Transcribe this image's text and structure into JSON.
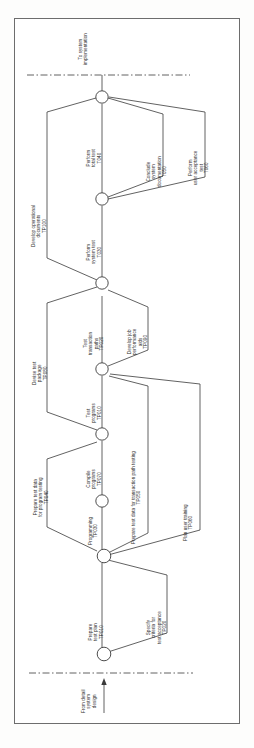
{
  "figure": {
    "type": "network-diagram",
    "orientation": "rotated-90-counterclockwise",
    "entry_label": "From detail\nsystem\ndesign",
    "entry_label_lines": [
      "From detail",
      "system",
      "design"
    ],
    "exit_label_lines": [
      "To system",
      "implementation"
    ],
    "boundary_style": "dash-dot"
  },
  "nodes": [
    {
      "id": "n1",
      "name": "event-node-1"
    },
    {
      "id": "n2",
      "name": "event-node-2"
    },
    {
      "id": "n3",
      "name": "event-node-3"
    },
    {
      "id": "n4",
      "name": "event-node-4"
    },
    {
      "id": "n5",
      "name": "event-node-5"
    },
    {
      "id": "n6",
      "name": "event-node-6"
    },
    {
      "id": "n7",
      "name": "event-node-7"
    },
    {
      "id": "n8",
      "name": "event-node-8"
    }
  ],
  "activities": [
    {
      "name": "Prepare\ntest plan",
      "lines": [
        "Prepare",
        "test plan"
      ],
      "code": "TP010"
    },
    {
      "name": "Specify\ncriteria for\ntest acceptance",
      "lines": [
        "Specify",
        "criteria for",
        "test acceptance"
      ],
      "code": "TP020"
    },
    {
      "name": "Programming",
      "lines": [
        "Programming"
      ],
      "code": "TP030"
    },
    {
      "name": "Prepare test data\nfor program testing",
      "lines": [
        "Prepare test data",
        "for program testing"
      ],
      "code": "TP040"
    },
    {
      "name": "Prepare test data for transaction path testing",
      "lines": [
        "Prepare test data for transaction path testing"
      ],
      "code": "TP050"
    },
    {
      "name": "Plan user training",
      "lines": [
        "Plan user training"
      ],
      "code": "TP060"
    },
    {
      "name": "Compile\nprograms",
      "lines": [
        "Compile",
        "programs"
      ],
      "code": "TP070"
    },
    {
      "name": "Test\nprograms",
      "lines": [
        "Test",
        "programs"
      ],
      "code": "TP010"
    },
    {
      "name": "Test\ntransaction\npaths",
      "lines": [
        "Test",
        "transaction",
        "paths"
      ],
      "code": "TP020"
    },
    {
      "name": "Develop job\nperformance\naids",
      "lines": [
        "Develop job",
        "performance",
        "aids"
      ],
      "code": "TP090"
    },
    {
      "name": "Devise test\npackage",
      "lines": [
        "Devise test",
        "package"
      ],
      "code": "TP080"
    },
    {
      "name": "Perform\nsystem test",
      "lines": [
        "Perform",
        "system test"
      ],
      "code": "T030"
    },
    {
      "name": "Develop operational\ndocuments",
      "lines": [
        "Develop operational",
        "documents"
      ],
      "code": "TP100"
    },
    {
      "name": "Perform\ntotal test",
      "lines": [
        "Perform",
        "total test"
      ],
      "code": "T040"
    },
    {
      "name": "Conclude\nsystem\ndocumentation",
      "lines": [
        "Conclude",
        "system",
        "documentation"
      ],
      "code": "T050"
    },
    {
      "name": "Perform\nuser acceptance\ntest",
      "lines": [
        "Perform",
        "user acceptance",
        "test"
      ],
      "code": "T060"
    }
  ],
  "labels": {
    "exit_line1": "To system",
    "exit_line2": "implementation",
    "entry_line1": "From detail",
    "entry_line2": "system",
    "entry_line3": "design",
    "a_prepare_test_plan_1": "Prepare",
    "a_prepare_test_plan_2": "test plan",
    "a_prepare_test_plan_code": "TP010",
    "a_specify_1": "Specify",
    "a_specify_2": "criteria for",
    "a_specify_3": "test acceptance",
    "a_specify_code": "TP020",
    "a_programming_1": "Programming",
    "a_programming_code": "TP030",
    "a_prep_prog_1": "Prepare test data",
    "a_prep_prog_2": "for program testing",
    "a_prep_prog_code": "TP040",
    "a_prep_trans_1": "Prepare test data for transaction path testing",
    "a_prep_trans_code": "TP050",
    "a_plan_training_1": "Plan user training",
    "a_plan_training_code": "TP060",
    "a_compile_1": "Compile",
    "a_compile_2": "programs",
    "a_compile_code": "TP070",
    "a_test_prog_1": "Test",
    "a_test_prog_2": "programs",
    "a_test_prog_code": "TP010",
    "a_test_trans_1": "Test",
    "a_test_trans_2": "transaction",
    "a_test_trans_3": "paths",
    "a_test_trans_code": "TP020",
    "a_job_aids_1": "Develop job",
    "a_job_aids_2": "performance",
    "a_job_aids_3": "aids",
    "a_job_aids_code": "TP090",
    "a_devise_1": "Devise test",
    "a_devise_2": "package",
    "a_devise_code": "TP080",
    "a_sys_test_1": "Perform",
    "a_sys_test_2": "system test",
    "a_sys_test_code": "T030",
    "a_dev_ops_1": "Develop operational",
    "a_dev_ops_2": "documents",
    "a_dev_ops_code": "TP100",
    "a_total_test_1": "Perform",
    "a_total_test_2": "total test",
    "a_total_test_code": "T040",
    "a_conclude_1": "Conclude",
    "a_conclude_2": "system",
    "a_conclude_3": "documentation",
    "a_conclude_code": "T050",
    "a_uat_1": "Perform",
    "a_uat_2": "user acceptance",
    "a_uat_3": "test",
    "a_uat_code": "T060"
  },
  "colors": {
    "line": "#3a3a3a",
    "frame": "#6d6d6d",
    "text": "#2a2a2a",
    "background": "#ffffff"
  }
}
